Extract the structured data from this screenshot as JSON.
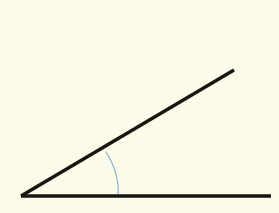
{
  "figure": {
    "title": "Angle formed by two rays",
    "type": "geometry-angle-diagram",
    "width": 279,
    "height": 213,
    "background_color": "#fdfce8",
    "stroke_color": "#17160f",
    "arc_color": "#8cb4dc",
    "vertex": {
      "x": 21,
      "y": 196
    },
    "rays": [
      {
        "name": "horizontal-ray",
        "from": {
          "x": 21,
          "y": 196
        },
        "to": {
          "x": 271,
          "y": 196
        },
        "stroke_width": 3.4,
        "color": "#17160f"
      },
      {
        "name": "diagonal-ray",
        "from": {
          "x": 21,
          "y": 196
        },
        "to": {
          "x": 234,
          "y": 70
        },
        "stroke_width": 3.4,
        "color": "#17160f"
      }
    ],
    "angle_arc": {
      "name": "angle-arc",
      "start": {
        "x": 106,
        "y": 152
      },
      "control": {
        "x": 120,
        "y": 174
      },
      "end": {
        "x": 118,
        "y": 197
      },
      "radius": 99,
      "stroke_width": 1.3,
      "color": "#8cb4dc",
      "measure_degrees": 30.6
    }
  }
}
